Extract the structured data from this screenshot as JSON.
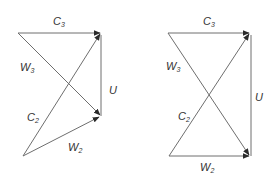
{
  "colors": {
    "line": "#6e6e6e",
    "arrowhead": "#2a2a2a",
    "text": "#333333",
    "background": "#ffffff"
  },
  "diagrams": [
    {
      "name": "velocity-triangle-left",
      "labels": {
        "c3": {
          "main": "C",
          "sub": "3"
        },
        "w3": {
          "main": "W",
          "sub": "3"
        },
        "u": {
          "main": "U",
          "sub": ""
        },
        "c2": {
          "main": "C",
          "sub": "2"
        },
        "w2": {
          "main": "W",
          "sub": "2"
        }
      }
    },
    {
      "name": "velocity-triangle-right",
      "labels": {
        "c3": {
          "main": "C",
          "sub": "3"
        },
        "w3": {
          "main": "W",
          "sub": "3"
        },
        "u": {
          "main": "U",
          "sub": ""
        },
        "c2": {
          "main": "C",
          "sub": "2"
        },
        "w2": {
          "main": "W",
          "sub": "2"
        }
      }
    }
  ]
}
